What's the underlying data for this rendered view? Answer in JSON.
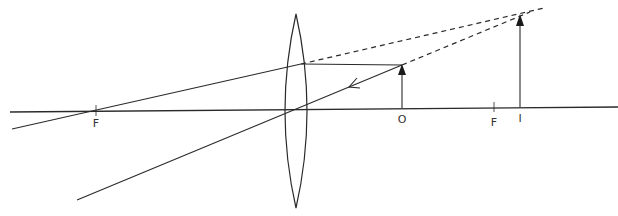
{
  "diagram": {
    "colors": {
      "line": "#2a2a2a",
      "label": "#333333",
      "background": "#ffffff"
    },
    "labels": {
      "focal_left": "F",
      "object": "O",
      "focal_right": "F",
      "image": "I"
    },
    "geometry": {
      "principal_axis": {
        "x1": 10,
        "y1": 112,
        "x2": 618,
        "y2": 107
      },
      "lens": {
        "cx": 296,
        "top": 14,
        "bottom": 208,
        "half_width": 11
      },
      "focal_left_x": 96,
      "focal_right_x": 494,
      "object": {
        "x": 402,
        "base_y": 108,
        "tip_y": 65
      },
      "image": {
        "x": 520,
        "base_y": 107,
        "tip_y": 14
      }
    },
    "rays": [
      {
        "name": "parallel-ray",
        "description": "from object tip parallel to axis, refracts through left focus"
      },
      {
        "name": "central-ray",
        "description": "from object tip through lens center, arrow pointing toward lens"
      }
    ],
    "virtual_rays": [
      {
        "name": "parallel-extension",
        "style": "dashed"
      },
      {
        "name": "central-extension",
        "style": "dashed"
      }
    ]
  }
}
